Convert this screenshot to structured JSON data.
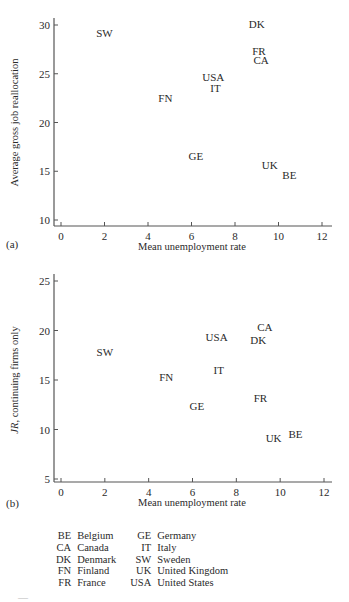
{
  "chart_data": [
    {
      "type": "scatter",
      "panel_label": "(a)",
      "title": "",
      "xlabel": "Mean unemployment rate",
      "ylabel": "Average gross job reallocation",
      "ylabel_italic_prefix": "",
      "xlim": [
        0,
        12
      ],
      "ylim": [
        10,
        30
      ],
      "xticks": [
        "0",
        "2",
        "4",
        "6",
        "8",
        "10",
        "12"
      ],
      "yticks": [
        "10",
        "15",
        "20",
        "25",
        "30"
      ],
      "grid": false,
      "marker": "text-label",
      "points": [
        {
          "label": "SW",
          "x": 2.0,
          "y": 29.2
        },
        {
          "label": "DK",
          "x": 9.0,
          "y": 30.1
        },
        {
          "label": "FR",
          "x": 9.1,
          "y": 27.3
        },
        {
          "label": "CA",
          "x": 9.2,
          "y": 26.4
        },
        {
          "label": "USA",
          "x": 7.0,
          "y": 24.7
        },
        {
          "label": "IT",
          "x": 7.1,
          "y": 23.5
        },
        {
          "label": "FN",
          "x": 4.8,
          "y": 22.5
        },
        {
          "label": "GE",
          "x": 6.2,
          "y": 16.6
        },
        {
          "label": "UK",
          "x": 9.6,
          "y": 15.6
        },
        {
          "label": "BE",
          "x": 10.5,
          "y": 14.6
        }
      ]
    },
    {
      "type": "scatter",
      "panel_label": "(b)",
      "title": "",
      "xlabel": "Mean unemployment rate",
      "ylabel": ", continuing firms only",
      "ylabel_italic_prefix": "JR",
      "xlim": [
        0,
        12
      ],
      "ylim": [
        5,
        25
      ],
      "xticks": [
        "0",
        "2",
        "4",
        "6",
        "8",
        "10",
        "12"
      ],
      "yticks": [
        "5",
        "10",
        "15",
        "20",
        "25"
      ],
      "grid": false,
      "marker": "text-label",
      "points": [
        {
          "label": "SW",
          "x": 2.0,
          "y": 17.8
        },
        {
          "label": "FN",
          "x": 4.8,
          "y": 15.3
        },
        {
          "label": "CA",
          "x": 9.3,
          "y": 20.4
        },
        {
          "label": "DK",
          "x": 9.0,
          "y": 19.0
        },
        {
          "label": "USA",
          "x": 7.1,
          "y": 19.3
        },
        {
          "label": "IT",
          "x": 7.2,
          "y": 16.0
        },
        {
          "label": "GE",
          "x": 6.2,
          "y": 12.4
        },
        {
          "label": "FR",
          "x": 9.1,
          "y": 13.2
        },
        {
          "label": "UK",
          "x": 9.7,
          "y": 9.1
        },
        {
          "label": "BE",
          "x": 10.7,
          "y": 9.5
        }
      ]
    }
  ],
  "legend": {
    "rows": [
      [
        {
          "code": "BE",
          "name": "Belgium"
        },
        {
          "code": "GE",
          "name": "Germany"
        }
      ],
      [
        {
          "code": "CA",
          "name": "Canada"
        },
        {
          "code": "IT",
          "name": "Italy"
        }
      ],
      [
        {
          "code": "DK",
          "name": "Denmark"
        },
        {
          "code": "SW",
          "name": "Sweden"
        }
      ],
      [
        {
          "code": "FN",
          "name": "Finland"
        },
        {
          "code": "UK",
          "name": "United Kingdom"
        }
      ],
      [
        {
          "code": "FR",
          "name": "France"
        },
        {
          "code": "USA",
          "name": "United States"
        }
      ]
    ]
  },
  "colors": {
    "ink": "#2a2a2a",
    "axis": "#555555"
  }
}
